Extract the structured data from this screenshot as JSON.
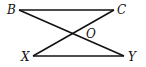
{
  "diagram": {
    "type": "geometry",
    "points": {
      "B": {
        "label": "B",
        "x": 19,
        "y": 10
      },
      "C": {
        "label": "C",
        "x": 114,
        "y": 10
      },
      "X": {
        "label": "X",
        "x": 33,
        "y": 56
      },
      "Y": {
        "label": "Y",
        "x": 124,
        "y": 56
      },
      "O": {
        "label": "O",
        "x": 72,
        "y": 34
      }
    },
    "segments": [
      [
        "B",
        "C"
      ],
      [
        "X",
        "Y"
      ],
      [
        "B",
        "Y"
      ],
      [
        "C",
        "X"
      ]
    ],
    "line_color": "#111111"
  }
}
